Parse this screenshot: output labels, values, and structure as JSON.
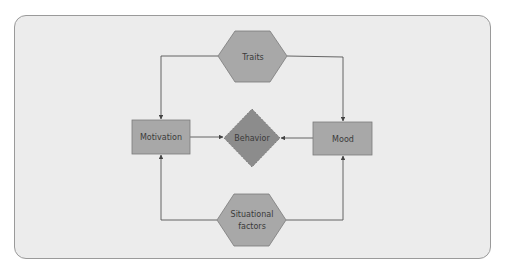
{
  "diagram": {
    "nodes": {
      "traits": {
        "label": "Traits",
        "shape": "hexagon"
      },
      "motivation": {
        "label": "Motivation",
        "shape": "rectangle"
      },
      "behavior": {
        "label": "Behavior",
        "shape": "diamond"
      },
      "mood": {
        "label": "Mood",
        "shape": "rectangle"
      },
      "situational": {
        "label_line1": "Situational",
        "label_line2": "factors",
        "shape": "hexagon"
      }
    },
    "edges": [
      {
        "from": "Traits",
        "to": "Motivation"
      },
      {
        "from": "Traits",
        "to": "Mood"
      },
      {
        "from": "Motivation",
        "to": "Behavior"
      },
      {
        "from": "Mood",
        "to": "Behavior"
      },
      {
        "from": "Situational factors",
        "to": "Motivation"
      },
      {
        "from": "Situational factors",
        "to": "Mood"
      }
    ],
    "colors": {
      "background": "#ececec",
      "frame_border": "#9a9a9a",
      "node_fill": "#a8a8a8",
      "diamond_fill": "#8c8c8c",
      "node_border": "#7a7a7a",
      "edge": "#555555",
      "text": "#3a3a3a"
    }
  }
}
